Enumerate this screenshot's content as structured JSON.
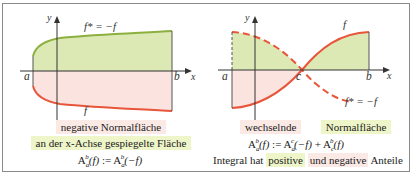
{
  "left_panel": {
    "axis_labels": {
      "y": "y",
      "x": "x",
      "a": "a",
      "b": "b"
    },
    "curve_labels": {
      "upper": "f* = −f",
      "lower": "f"
    },
    "captions": {
      "line1": "negative Normalfläche",
      "line2": "an der x-Achse gespiegelte Fläche",
      "formula_lhs": "A",
      "formula_sup": "b",
      "formula_sub": "a",
      "formula_lhs_arg": "(f)",
      "formula_op": " := ",
      "formula_rhs": "A",
      "formula_rhs_sup": "b",
      "formula_rhs_sub": "a",
      "formula_rhs_arg": "(−f)"
    }
  },
  "right_panel": {
    "axis_labels": {
      "y": "y",
      "x": "x",
      "a": "a",
      "b": "b",
      "c": "c"
    },
    "curve_labels": {
      "solid": "f",
      "dashed": "f* = −f"
    },
    "captions": {
      "word1": "wechselnde",
      "word2": "Normalfläche",
      "formula": "A_a^b(f) := A_a^c(−f) + A_c^b(f)",
      "line3_pre": "Integral hat",
      "line3_pos": "positive",
      "line3_mid": "und negative",
      "line3_end": "Anteile"
    }
  },
  "colors": {
    "green_fill": "#dde9b4",
    "pink_fill": "#fbe3df",
    "green_line": "#8cb040",
    "red_line": "#e8553a",
    "axis": "#333333",
    "frame": "#8a8a8a"
  }
}
